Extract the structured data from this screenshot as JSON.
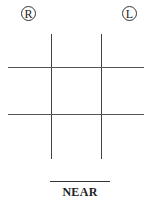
{
  "markers": {
    "right": {
      "label": "R",
      "icon": "circled-r-icon"
    },
    "left": {
      "label": "L",
      "icon": "circled-l-icon"
    }
  },
  "grid": {
    "type": "tic-tac-toe",
    "vertical_lines": 2,
    "horizontal_lines": 2,
    "line_color": "#444444"
  },
  "caption": {
    "text": "NEAR"
  }
}
